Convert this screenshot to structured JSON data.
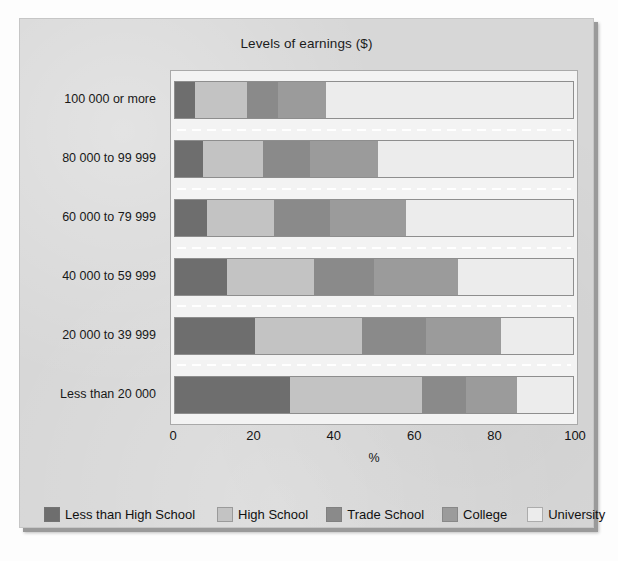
{
  "chart_data": {
    "type": "bar",
    "subtype": "100% stacked horizontal bar",
    "title": "Levels of earnings ($)",
    "xlabel": "%",
    "ylabel": "",
    "xlim": [
      0,
      100
    ],
    "xticks": [
      "0",
      "20",
      "40",
      "60",
      "80",
      "100"
    ],
    "grid": false,
    "legend_position": "bottom",
    "categories": [
      "Less than 20 000",
      "20 000 to 39 999",
      "40 000 to 59 999",
      "60 000 to 79 999",
      "80 000 to 99 999",
      "100 000 or more"
    ],
    "categories_top_to_bottom": [
      "100 000 or more",
      "80 000 to 99 999",
      "60 000 to 79 999",
      "40 000 to 59 999",
      "20 000 to 39 999",
      "Less than 20 000"
    ],
    "series": [
      {
        "name": "Less than High School",
        "color": "#6e6e6e",
        "values_top_to_bottom": [
          5,
          7,
          8,
          13,
          20,
          29
        ]
      },
      {
        "name": "High School",
        "color": "#c3c3c3",
        "values_top_to_bottom": [
          13,
          15,
          17,
          22,
          27,
          33
        ]
      },
      {
        "name": "Trade School",
        "color": "#8a8a8a",
        "values_top_to_bottom": [
          8,
          12,
          14,
          15,
          16,
          11
        ]
      },
      {
        "name": "College",
        "color": "#9b9b9b",
        "values_top_to_bottom": [
          12,
          17,
          19,
          21,
          19,
          13
        ]
      },
      {
        "name": "University",
        "color": "#ececec",
        "values_top_to_bottom": [
          62,
          49,
          42,
          29,
          18,
          14
        ]
      }
    ],
    "rows": [
      {
        "label": "100 000 or more",
        "segments": [
          {
            "name": "Less than High School",
            "value": 5
          },
          {
            "name": "High School",
            "value": 13
          },
          {
            "name": "Trade School",
            "value": 8
          },
          {
            "name": "College",
            "value": 12
          },
          {
            "name": "University",
            "value": 62
          }
        ]
      },
      {
        "label": "80 000 to 99 999",
        "segments": [
          {
            "name": "Less than High School",
            "value": 7
          },
          {
            "name": "High School",
            "value": 15
          },
          {
            "name": "Trade School",
            "value": 12
          },
          {
            "name": "College",
            "value": 17
          },
          {
            "name": "University",
            "value": 49
          }
        ]
      },
      {
        "label": "60 000 to 79 999",
        "segments": [
          {
            "name": "Less than High School",
            "value": 8
          },
          {
            "name": "High School",
            "value": 17
          },
          {
            "name": "Trade School",
            "value": 14
          },
          {
            "name": "College",
            "value": 19
          },
          {
            "name": "University",
            "value": 42
          }
        ]
      },
      {
        "label": "40 000 to 59 999",
        "segments": [
          {
            "name": "Less than High School",
            "value": 13
          },
          {
            "name": "High School",
            "value": 22
          },
          {
            "name": "Trade School",
            "value": 15
          },
          {
            "name": "College",
            "value": 21
          },
          {
            "name": "University",
            "value": 29
          }
        ]
      },
      {
        "label": "20 000 to 39 999",
        "segments": [
          {
            "name": "Less than High School",
            "value": 20
          },
          {
            "name": "High School",
            "value": 27
          },
          {
            "name": "Trade School",
            "value": 16
          },
          {
            "name": "College",
            "value": 19
          },
          {
            "name": "University",
            "value": 18
          }
        ]
      },
      {
        "label": "Less than 20 000",
        "segments": [
          {
            "name": "Less than High School",
            "value": 29
          },
          {
            "name": "High School",
            "value": 33
          },
          {
            "name": "Trade School",
            "value": 11
          },
          {
            "name": "College",
            "value": 13
          },
          {
            "name": "University",
            "value": 14
          }
        ]
      }
    ],
    "legend": [
      {
        "label": "Less than High School",
        "color": "#6e6e6e"
      },
      {
        "label": "High School",
        "color": "#c3c3c3"
      },
      {
        "label": "Trade School",
        "color": "#8a8a8a"
      },
      {
        "label": "College",
        "color": "#9b9b9b"
      },
      {
        "label": "University",
        "color": "#ececec"
      }
    ]
  },
  "theme": {
    "page_background": "#d7d7d7",
    "plot_background": "#f3f3f3",
    "plot_border": "#a9a9a9",
    "text_color": "#141414",
    "separator_color": "#ffffff"
  }
}
